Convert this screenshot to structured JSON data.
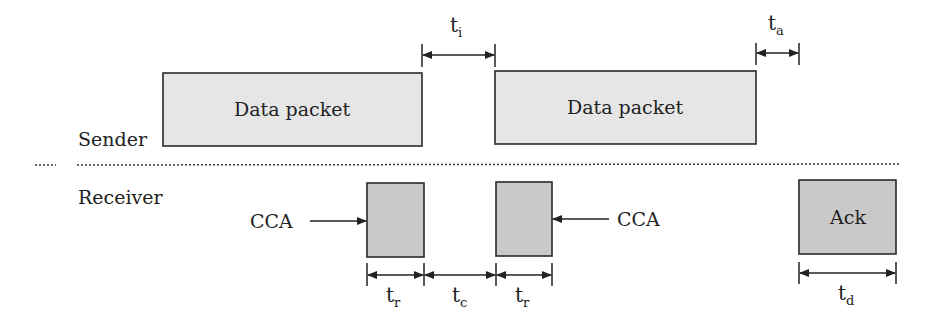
{
  "diagram": {
    "lanes": {
      "sender_label": "Sender",
      "receiver_label": "Receiver"
    },
    "sender_packets": [
      {
        "label": "Data packet",
        "x": 163,
        "y": 73,
        "w": 259,
        "h": 73
      },
      {
        "label": "Data packet",
        "x": 495,
        "y": 71,
        "w": 261,
        "h": 73
      }
    ],
    "receiver_boxes": [
      {
        "label": "",
        "x": 367,
        "y": 183,
        "w": 57,
        "h": 74
      },
      {
        "label": "",
        "x": 496,
        "y": 182,
        "w": 56,
        "h": 74
      },
      {
        "label": "Ack",
        "x": 799,
        "y": 180,
        "w": 97,
        "h": 74
      }
    ],
    "cca_labels": [
      {
        "text": "CCA",
        "side": "left"
      },
      {
        "text": "CCA",
        "side": "right"
      }
    ],
    "intervals": {
      "t_i": {
        "base": "t",
        "sub": "i"
      },
      "t_a": {
        "base": "t",
        "sub": "a"
      },
      "t_r1": {
        "base": "t",
        "sub": "r"
      },
      "t_c": {
        "base": "t",
        "sub": "c"
      },
      "t_r2": {
        "base": "t",
        "sub": "r"
      },
      "t_d": {
        "base": "t",
        "sub": "d"
      }
    },
    "colors": {
      "packet_fill": "#e6e6e6",
      "receiver_fill": "#c9c9c9",
      "stroke": "#2a2a2a"
    }
  }
}
